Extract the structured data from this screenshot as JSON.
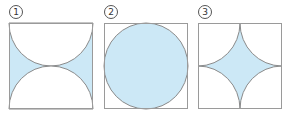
{
  "colors": {
    "fill": "#cce8f6",
    "stroke": "#8a8a8a",
    "border": "#9a9a9a"
  },
  "figures": [
    {
      "label": "1",
      "description": "Square with two semicircles (top and bottom) removed; shaded region between them"
    },
    {
      "label": "2",
      "description": "Square with two quarter circles removed from top corners; shaded region below"
    },
    {
      "label": "3",
      "description": "Square with four quarter circles removed from corners; shaded star-shaped region in center"
    }
  ]
}
